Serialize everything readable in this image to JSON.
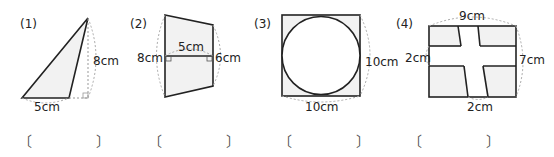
{
  "problems": [
    {
      "number": "(1)",
      "shape": "triangle",
      "labels": {
        "height": "8cm",
        "base": "5cm"
      }
    },
    {
      "number": "(2)",
      "shape": "trapezoid",
      "labels": {
        "left": "8cm",
        "middle": "5cm",
        "right": "6cm"
      }
    },
    {
      "number": "(3)",
      "shape": "square-with-inscribed-circle",
      "labels": {
        "right": "10cm",
        "bottom": "10cm"
      }
    },
    {
      "number": "(4)",
      "shape": "rectangle-with-cross-roads",
      "labels": {
        "top": "9cm",
        "left": "2cm",
        "right": "7cm",
        "bottom": "2cm"
      }
    }
  ],
  "answer_brackets": {
    "open": "〔",
    "close": "〕"
  },
  "colors": {
    "stroke": "#222222",
    "fill": "#f2f2f2",
    "dotted": "#999999"
  }
}
